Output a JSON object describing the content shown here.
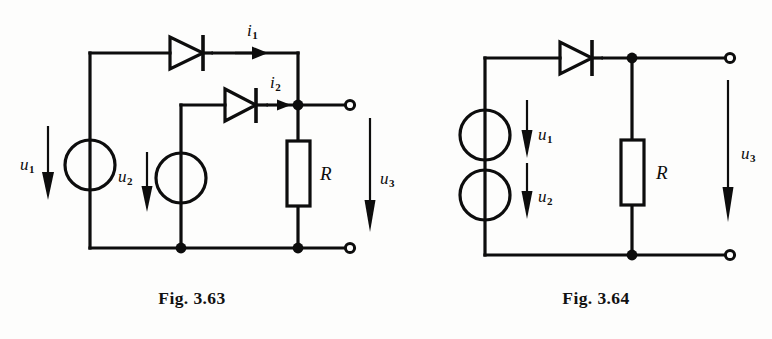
{
  "page": {
    "background": "#fdfdfc",
    "ink": "#0d0d0d",
    "width": 772,
    "height": 339
  },
  "figures": [
    {
      "id": "fig-3-63",
      "caption": "Fig. 3.63",
      "description": "Two voltage sources u1 and u2 each feeding a diode into a common node across resistor R, output u3",
      "labels": {
        "u1": "u",
        "u1_sub": "1",
        "u2": "u",
        "u2_sub": "2",
        "u3": "u",
        "u3_sub": "3",
        "i1": "i",
        "i1_sub": "1",
        "i2": "i",
        "i2_sub": "2",
        "R": "R"
      },
      "components": [
        {
          "name": "voltage-source-u1",
          "type": "ideal-source",
          "label": "u1"
        },
        {
          "name": "voltage-source-u2",
          "type": "ideal-source",
          "label": "u2"
        },
        {
          "name": "diode-d1",
          "type": "diode",
          "direction": "right"
        },
        {
          "name": "diode-d2",
          "type": "diode",
          "direction": "right"
        },
        {
          "name": "resistor-r",
          "type": "resistor",
          "label": "R"
        },
        {
          "name": "current-arrow-i1",
          "type": "current-arrow",
          "label": "i1"
        },
        {
          "name": "current-arrow-i2",
          "type": "current-arrow",
          "label": "i2"
        },
        {
          "name": "terminal-top",
          "type": "open-terminal"
        },
        {
          "name": "terminal-bottom",
          "type": "open-terminal"
        }
      ]
    },
    {
      "id": "fig-3-64",
      "caption": "Fig. 3.64",
      "description": "Two series voltage sources u1 and u2 feeding one diode into resistor R, output u3",
      "labels": {
        "u1": "u",
        "u1_sub": "1",
        "u2": "u",
        "u2_sub": "2",
        "u3": "u",
        "u3_sub": "3",
        "R": "R"
      },
      "components": [
        {
          "name": "voltage-source-u1",
          "type": "ideal-source",
          "label": "u1"
        },
        {
          "name": "voltage-source-u2",
          "type": "ideal-source",
          "label": "u2"
        },
        {
          "name": "diode-d1",
          "type": "diode",
          "direction": "right"
        },
        {
          "name": "resistor-r",
          "type": "resistor",
          "label": "R"
        },
        {
          "name": "terminal-top",
          "type": "open-terminal"
        },
        {
          "name": "terminal-bottom",
          "type": "open-terminal"
        }
      ]
    }
  ]
}
